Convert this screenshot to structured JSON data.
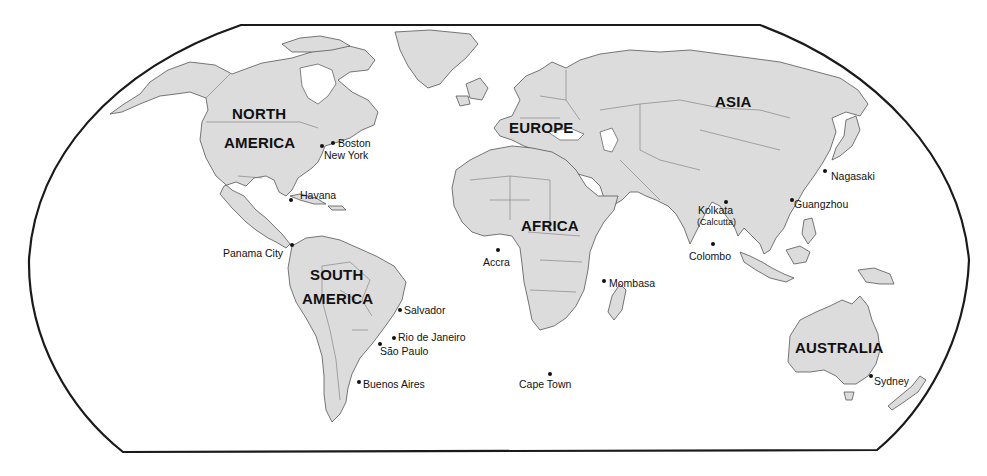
{
  "map": {
    "projection_frame": "robinson-style rounded frame",
    "colors": {
      "land": "#dcdcdc",
      "ocean": "#ffffff",
      "outline": "#555555",
      "frame": "#1a1a1a",
      "text": "#111111"
    },
    "continents": [
      {
        "id": "north-america",
        "label_line1": "NORTH",
        "label_line2": "AMERICA"
      },
      {
        "id": "south-america",
        "label_line1": "SOUTH",
        "label_line2": "AMERICA"
      },
      {
        "id": "europe",
        "label": "EUROPE"
      },
      {
        "id": "africa",
        "label": "AFRICA"
      },
      {
        "id": "asia",
        "label": "ASIA"
      },
      {
        "id": "australia",
        "label": "AUSTRALIA"
      }
    ],
    "cities": [
      {
        "name": "Boston"
      },
      {
        "name": "New York"
      },
      {
        "name": "Havana"
      },
      {
        "name": "Panama City"
      },
      {
        "name": "Salvador"
      },
      {
        "name": "Rio de Janeiro"
      },
      {
        "name": "São Paulo"
      },
      {
        "name": "Buenos Aires"
      },
      {
        "name": "Accra"
      },
      {
        "name": "Mombasa"
      },
      {
        "name": "Cape Town"
      },
      {
        "name": "Kolkata",
        "sub": "(Calcutta)"
      },
      {
        "name": "Colombo"
      },
      {
        "name": "Guangzhou"
      },
      {
        "name": "Nagasaki"
      },
      {
        "name": "Sydney"
      }
    ]
  }
}
